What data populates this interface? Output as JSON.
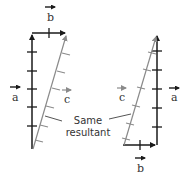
{
  "figure": {
    "caption": "Same resultant",
    "caption_lines": [
      "Same",
      "resultant"
    ],
    "colors": {
      "vector": "#1a1a1a",
      "resultant": "#8a8a8a",
      "text": "#333333",
      "background": "#ffffff"
    },
    "left_diagram": {
      "labels": {
        "a": "a",
        "b": "b",
        "c": "c"
      },
      "order": "a then b"
    },
    "right_diagram": {
      "labels": {
        "a": "a",
        "b": "b",
        "c": "c"
      },
      "order": "b then a"
    }
  }
}
